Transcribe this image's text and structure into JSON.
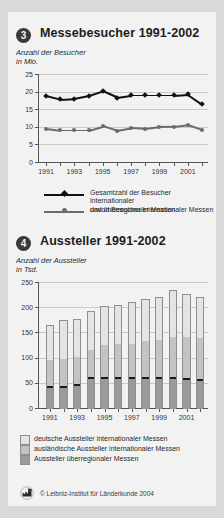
{
  "footer": {
    "copyright": "© Leibniz-Institut für Länderkunde 2004",
    "logo_icon": "ifl-logo-icon"
  },
  "charts": [
    {
      "number": "3",
      "title": "Messebesucher 1991-2002",
      "subtitle": "Anzahl der Besucher\nin Mio.",
      "legend": [
        "Gesamtzahl der Besucher internationaler\nund überregionaler Messen",
        "davon Besucher internationaler Messen"
      ]
    },
    {
      "number": "4",
      "title": "Aussteller 1991-2002",
      "subtitle": "Anzahl der Aussteller\nin Tsd.",
      "legend": [
        "deutsche Aussteller internationaler Messen",
        "ausländische Aussteller internationaler Messen",
        "Aussteller überregionaler Messen"
      ]
    }
  ],
  "chart_data": [
    {
      "type": "line",
      "title": "Messebesucher 1991-2002",
      "ylabel": "Anzahl der Besucher in Mio.",
      "xlabel": "",
      "ylim": [
        0,
        25
      ],
      "yticks": [
        0,
        5,
        10,
        15,
        20,
        25
      ],
      "xticks_labeled": [
        "1991",
        "1993",
        "1995",
        "1997",
        "1999",
        "2001"
      ],
      "grid": true,
      "legend_position": "below",
      "x": [
        1991,
        1992,
        1993,
        1994,
        1995,
        1996,
        1997,
        1998,
        1999,
        2000,
        2001,
        2002
      ],
      "series": [
        {
          "name": "Gesamtzahl der Besucher internationaler und überregionaler Messen",
          "color": "#111111",
          "marker": "diamond",
          "values": [
            18.8,
            17.8,
            18.0,
            18.8,
            20.1,
            18.3,
            18.9,
            18.9,
            18.9,
            18.9,
            19.2,
            16.4
          ]
        },
        {
          "name": "davon Besucher internationaler Messen",
          "color": "#6b6b6b",
          "marker": "circle",
          "values": [
            9.5,
            9.0,
            9.0,
            9.0,
            10.2,
            8.9,
            9.6,
            9.4,
            9.9,
            10.0,
            10.5,
            9.1
          ]
        }
      ]
    },
    {
      "type": "bar",
      "title": "Aussteller 1991-2002",
      "ylabel": "Anzahl der Aussteller in Tsd.",
      "xlabel": "",
      "ylim": [
        0,
        250
      ],
      "yticks": [
        0,
        50,
        100,
        150,
        200,
        250
      ],
      "stacked": true,
      "grid": true,
      "legend_position": "below",
      "categories": [
        "1991",
        "1992",
        "1993",
        "1994",
        "1995",
        "1996",
        "1997",
        "1998",
        "1999",
        "2000",
        "2001",
        "2002"
      ],
      "series": [
        {
          "name": "deutsche Aussteller internationaler Messen",
          "color": "#9a9a9a",
          "values": [
            44,
            44,
            48,
            61,
            61,
            61,
            61,
            62,
            61,
            61,
            60,
            57
          ]
        },
        {
          "name": "ausländische Aussteller internationaler Messen",
          "color": "#c3c3c3",
          "values": [
            53,
            56,
            56,
            57,
            65,
            68,
            68,
            73,
            75,
            81,
            83,
            83
          ]
        },
        {
          "name": "Aussteller überregionaler Messen",
          "color": "#e4e4e4",
          "values": [
            67,
            75,
            73,
            75,
            76,
            76,
            81,
            81,
            85,
            93,
            84,
            81
          ]
        }
      ],
      "totals": [
        164,
        175,
        177,
        193,
        202,
        205,
        210,
        216,
        221,
        235,
        227,
        221
      ]
    }
  ]
}
